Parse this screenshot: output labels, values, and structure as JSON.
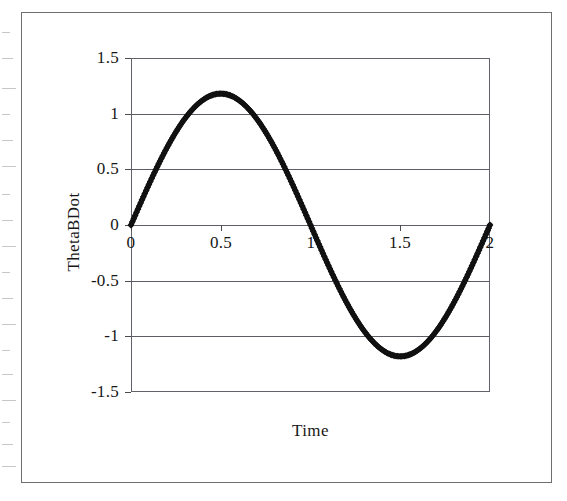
{
  "figure": {
    "background_color": "#ffffff",
    "border_color": "#6f6f73",
    "axis_color": "#5d5d65",
    "series_color": "#111111"
  },
  "axis_titles": {
    "x": "Time",
    "y": "ThetaBDot"
  },
  "chart_data": {
    "type": "scatter",
    "title": "",
    "subtitle": "",
    "xlabel": "Time",
    "ylabel": "ThetaBDot",
    "xlim": [
      0,
      2
    ],
    "ylim": [
      -1.5,
      1.5
    ],
    "xticks": [
      0,
      0.5,
      1,
      1.5,
      2
    ],
    "yticks": [
      -1.5,
      -1,
      -0.5,
      0,
      0.5,
      1,
      1.5
    ],
    "xtick_labels": [
      "0",
      "0.5",
      "1",
      "1.5",
      "2"
    ],
    "ytick_labels": [
      "1.5",
      "1",
      "0.5",
      "0",
      "-0.5",
      "-1",
      "-1.5"
    ],
    "grid": "horizontal",
    "legend": "none",
    "marker": "filled-diamond",
    "marker_color": "#111111",
    "series": [
      {
        "name": "ThetaBDot",
        "amplitude": 1.18,
        "period": 2.0,
        "phase": 0,
        "x": [
          0,
          0.05,
          0.1,
          0.15,
          0.2,
          0.25,
          0.3,
          0.35,
          0.4,
          0.45,
          0.5,
          0.55,
          0.6,
          0.65,
          0.7,
          0.75,
          0.8,
          0.85,
          0.9,
          0.95,
          1.0,
          1.05,
          1.1,
          1.15,
          1.2,
          1.25,
          1.3,
          1.35,
          1.4,
          1.45,
          1.5,
          1.55,
          1.6,
          1.65,
          1.7,
          1.75,
          1.8,
          1.85,
          1.9,
          1.95,
          2.0
        ],
        "y": [
          0,
          0.18,
          0.36,
          0.53,
          0.69,
          0.83,
          0.95,
          1.06,
          1.13,
          1.17,
          1.18,
          1.17,
          1.13,
          1.06,
          0.95,
          0.83,
          0.69,
          0.53,
          0.36,
          0.18,
          0,
          -0.18,
          -0.36,
          -0.53,
          -0.69,
          -0.83,
          -0.95,
          -1.06,
          -1.13,
          -1.17,
          -1.18,
          -1.17,
          -1.13,
          -1.06,
          -0.95,
          -0.83,
          -0.69,
          -0.53,
          -0.36,
          -0.18,
          0
        ]
      }
    ],
    "annotations": [
      "Peak value approximately 1.18 at Time = 0.5",
      "Zero crossing at Time = 1.0",
      "Trough value approximately -1.18 at Time = 1.5",
      "Returns to 0 at Time = 2.0"
    ]
  }
}
